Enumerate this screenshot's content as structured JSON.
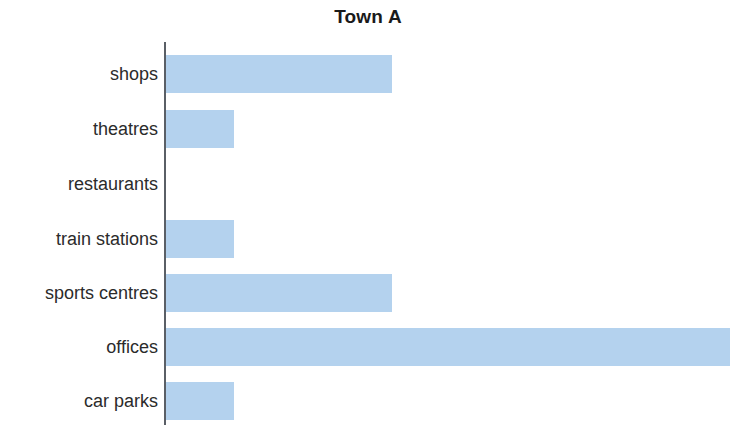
{
  "chart": {
    "title": "Town A"
  },
  "axis": {
    "line_color": "#5a5f66"
  },
  "style": {
    "bar_color": "#b4d2ee",
    "title_color": "#1a1a1a",
    "label_color": "#2b2b2b"
  },
  "chart_data": {
    "type": "bar",
    "orientation": "horizontal",
    "title": "Town A",
    "xlabel": "",
    "ylabel": "",
    "categories": [
      "shops",
      "theatres",
      "restaurants",
      "train stations",
      "sports centres",
      "offices",
      "car parks"
    ],
    "values": [
      10,
      3,
      0,
      3,
      10,
      25,
      3
    ],
    "series": [
      {
        "name": "Town A",
        "values": [
          10,
          3,
          0,
          3,
          10,
          25,
          3
        ]
      }
    ],
    "xlim": [
      0,
      25
    ],
    "grid": false,
    "legend": false,
    "tick_labels_x": [],
    "annotations": []
  }
}
